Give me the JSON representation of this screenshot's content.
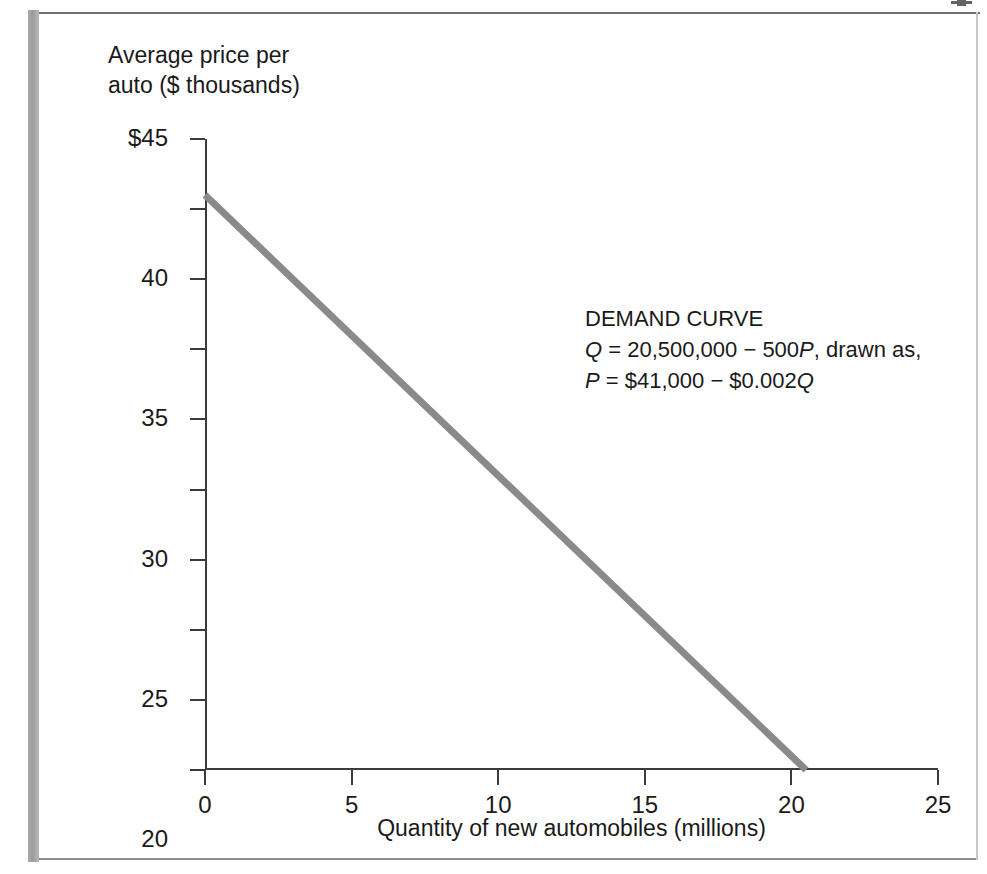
{
  "figure": {
    "y_axis_title": "Average price per\nauto ($ thousands)",
    "x_axis_title": "Quantity of new automobiles (millions)"
  },
  "annotation": {
    "heading": "DEMAND CURVE",
    "line2_pre": "Q",
    "line2_body": " = 20,500,000 − 500",
    "line2_var": "P",
    "line2_post": ", drawn as,",
    "line3_pre": "P",
    "line3_body": " = $41,000 − $0.002",
    "line3_var": "Q"
  },
  "colors": {
    "curve": "#8a8a8a",
    "axis": "#3b3b3b",
    "text": "#1a1a1a",
    "page_bar": "#9c9c9c"
  },
  "chart_data": {
    "type": "line",
    "title": "DEMAND CURVE",
    "xlabel": "Quantity of new automobiles (millions)",
    "ylabel": "Average price per auto ($ thousands)",
    "xlim": [
      0,
      25
    ],
    "ylim": [
      0,
      45
    ],
    "xticks": [
      0,
      5,
      10,
      15,
      20,
      25
    ],
    "xticklabels": [
      "0",
      "5",
      "10",
      "15",
      "20",
      "25"
    ],
    "yticks": [
      0,
      5,
      10,
      15,
      20,
      25,
      30,
      35,
      40,
      45
    ],
    "yticklabels": [
      "0",
      "5",
      "10",
      "15",
      "20",
      "25",
      "30",
      "35",
      "40",
      "$45"
    ],
    "grid": false,
    "legend": false,
    "series": [
      {
        "name": "Demand curve",
        "color": "#8a8a8a",
        "linewidth": 7,
        "equation_quantity": "Q = 20,500,000 − 500P",
        "equation_price": "P = $41,000 − $0.002Q",
        "x": [
          0,
          20.5
        ],
        "y": [
          41,
          0
        ],
        "points": [
          {
            "x": 0,
            "y": 41
          },
          {
            "x": 5,
            "y": 31
          },
          {
            "x": 10,
            "y": 21
          },
          {
            "x": 15,
            "y": 11
          },
          {
            "x": 20,
            "y": 1
          },
          {
            "x": 20.5,
            "y": 0
          }
        ]
      }
    ]
  }
}
